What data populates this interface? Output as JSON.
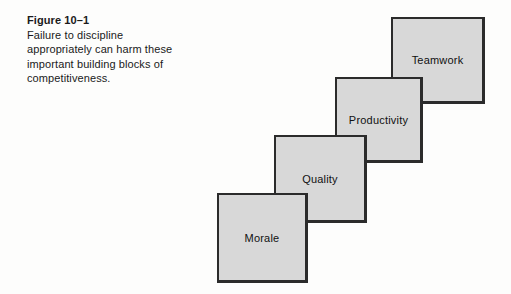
{
  "figure": {
    "label": "Figure 10–1",
    "caption": "Failure to discipline appropriately can harm these important building blocks of competitiveness."
  },
  "diagram": {
    "blocks": [
      {
        "label": "Teamwork"
      },
      {
        "label": "Productivity"
      },
      {
        "label": "Quality"
      },
      {
        "label": "Morale"
      }
    ],
    "colors": {
      "block_fill": "#d8d8d8",
      "block_border": "#2b2b2b",
      "text": "#1a1a1a",
      "background": "#fdfdfc"
    }
  }
}
